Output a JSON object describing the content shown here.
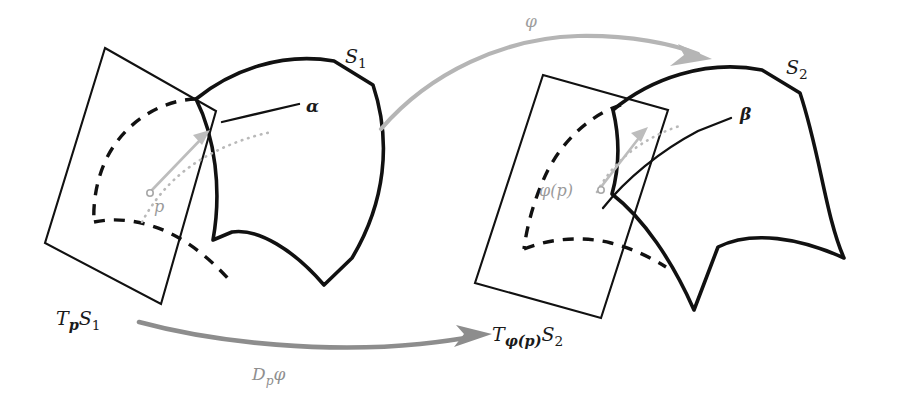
{
  "figure": {
    "background_color": "#ffffff",
    "ink_color": "#111111",
    "gray_light": "#b5b5b5",
    "gray_mid": "#9e9e9e",
    "gray_dark": "#8d8d8d"
  },
  "labels": {
    "surface_1": "S",
    "surface_1_sub": "1",
    "surface_2": "S",
    "surface_2_sub": "2",
    "curve_alpha": "α",
    "curve_beta": "β",
    "point_p": "p",
    "point_phi_p": "φ(p)",
    "tangent_plane_1_T": "T",
    "tangent_plane_1_sub": "p",
    "tangent_plane_1_S": "S",
    "tangent_plane_1_S_sub": "1",
    "tangent_plane_2_T": "T",
    "tangent_plane_2_sub": "φ(p)",
    "tangent_plane_2_S": "S",
    "tangent_plane_2_S_sub": "2",
    "map_phi": "φ",
    "differential_D": "D",
    "differential_sub": "p",
    "differential_phi": "φ"
  },
  "elements": {
    "surface_1_name": "surface-S1",
    "surface_2_name": "surface-S2",
    "plane_1_name": "tangent-plane-TpS1",
    "plane_2_name": "tangent-plane-TphipS2",
    "arrow_top_name": "map-arrow-phi",
    "arrow_bottom_name": "differential-arrow-Dpphi"
  }
}
